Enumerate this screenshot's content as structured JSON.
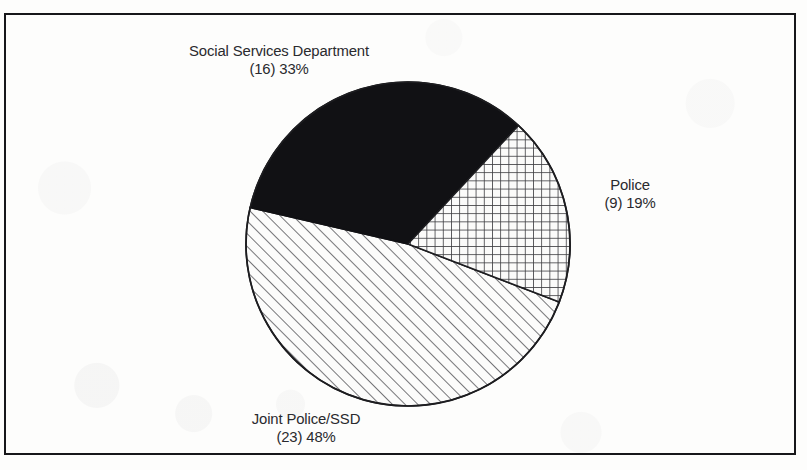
{
  "figure": {
    "frame": {
      "border_color": "#17171a",
      "background": "#fdfdfc"
    }
  },
  "chart_data": {
    "type": "pie",
    "title": "",
    "subtitle": "",
    "xlabel": "",
    "ylabel": "",
    "legend_position": "none",
    "grid": false,
    "total_count": 48,
    "categories": [
      "Social Services Department",
      "Police",
      "Joint Police/SSD"
    ],
    "values": [
      16,
      9,
      23
    ],
    "percentages": [
      33,
      19,
      48
    ],
    "slices": [
      {
        "name": "Social Services Department",
        "count": 16,
        "percent": 33,
        "label_name": "Social Services Department",
        "label_value": "(16) 33%",
        "fill": "solid-black",
        "fill_color": "#111114",
        "start_angle_deg": 283,
        "end_angle_deg": 43,
        "label_position": "top-left"
      },
      {
        "name": "Police",
        "count": 9,
        "percent": 19,
        "label_name": "Police",
        "label_value": "(9) 19%",
        "fill": "cross-hatch-grid",
        "fill_color": "#3a3a3e",
        "start_angle_deg": 43,
        "end_angle_deg": 111,
        "label_position": "right"
      },
      {
        "name": "Joint Police/SSD",
        "count": 23,
        "percent": 48,
        "label_name": "Joint Police/SSD",
        "label_value": "(23) 48%",
        "fill": "diagonal-hatch-45",
        "fill_color": "#4a4a4e",
        "start_angle_deg": 111,
        "end_angle_deg": 283,
        "label_position": "bottom-left"
      }
    ],
    "geometry": {
      "center_x": 408,
      "center_y": 244,
      "radius": 162
    }
  }
}
